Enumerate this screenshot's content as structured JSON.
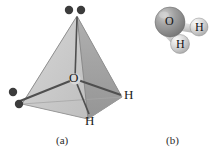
{
  "figure": {
    "background_color": "#ffffff",
    "width": 216,
    "height": 163
  },
  "panel_a": {
    "caption": "(a)",
    "caption_x": 56,
    "caption_y": 136,
    "description": "tetrahedral electron-pair geometry of water drawn as a shaded tetrahedron",
    "colors": {
      "face_left": "#c9c9c9",
      "face_right": "#a8a8a8",
      "face_front": "#d9d9d9",
      "face_bottom": "#bdbdbd",
      "edge": "#7a7a7a",
      "bond": "#4a4a4a",
      "lone_pair_dot": "#3a3a3a"
    },
    "vertices": {
      "apex": {
        "x": 77,
        "y": 16
      },
      "left": {
        "x": 22,
        "y": 104
      },
      "right": {
        "x": 122,
        "y": 97
      },
      "front": {
        "x": 88,
        "y": 119
      },
      "center_o": {
        "x": 75,
        "y": 79
      }
    },
    "atom_labels": [
      {
        "name": "oxygen",
        "text": "O",
        "x": 69,
        "y": 72
      },
      {
        "name": "hydrogen-right",
        "text": "H",
        "x": 124,
        "y": 89
      },
      {
        "name": "hydrogen-front",
        "text": "H",
        "x": 86,
        "y": 115
      }
    ],
    "lone_pairs": [
      {
        "name": "lone-pair-top",
        "dots": [
          {
            "x": 69,
            "y": 10
          },
          {
            "x": 81,
            "y": 10
          }
        ]
      },
      {
        "name": "lone-pair-left",
        "dots": [
          {
            "x": 13,
            "y": 92
          },
          {
            "x": 19,
            "y": 103
          }
        ]
      }
    ],
    "dot_radius": 4.2
  },
  "panel_b": {
    "caption": "(b)",
    "caption_x": 166,
    "caption_y": 136,
    "description": "ball-and-stick / space-filling model of water",
    "colors": {
      "oxygen_sphere": "#8c8c8c",
      "oxygen_highlight": "#c7c7c7",
      "hydrogen_sphere": "#cfcfcf",
      "hydrogen_highlight": "#f2f2f2",
      "bond": "#d2d2d2",
      "outline": "#6e6e6e"
    },
    "atoms": [
      {
        "name": "oxygen",
        "text": "O",
        "cx": 170,
        "cy": 92,
        "r": 15,
        "label_x": 165,
        "label_y": 86
      },
      {
        "name": "hydrogen-right",
        "text": "H",
        "cx": 199,
        "cy": 97,
        "r": 9,
        "label_x": 195,
        "label_y": 92
      },
      {
        "name": "hydrogen-lower",
        "text": "H",
        "cx": 180,
        "cy": 114,
        "r": 9.5,
        "label_x": 176,
        "label_y": 109
      }
    ]
  }
}
